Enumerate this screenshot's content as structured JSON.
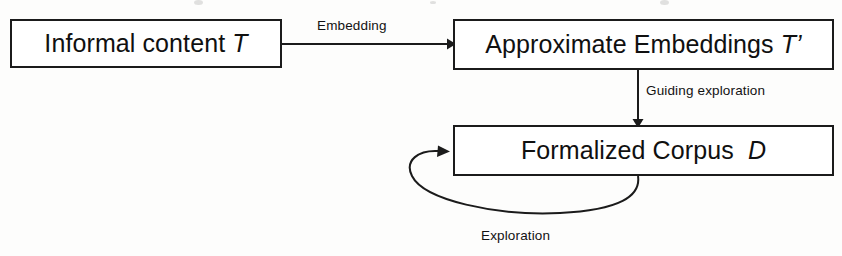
{
  "diagram": {
    "stroke_color": "#1b1b1b",
    "background_color": "#fdfdfc",
    "nodes": [
      {
        "id": "informal-content",
        "label": "Informal content ",
        "symbol": "T",
        "shape": "rectangle"
      },
      {
        "id": "approximate-embeddings",
        "label": "Approximate Embeddings ",
        "symbol": "T’",
        "shape": "rectangle"
      },
      {
        "id": "formalized-corpus",
        "label": "Formalized Corpus  ",
        "symbol": "D",
        "shape": "rectangle"
      }
    ],
    "edges": [
      {
        "id": "embedding-edge",
        "label": "Embedding",
        "from": "informal-content",
        "to": "approximate-embeddings",
        "direction": "right"
      },
      {
        "id": "guiding-exploration-edge",
        "label": "Guiding exploration",
        "from": "approximate-embeddings",
        "to": "formalized-corpus",
        "direction": "down"
      },
      {
        "id": "exploration-loop-edge",
        "label": "Exploration",
        "from": "formalized-corpus",
        "to": "formalized-corpus",
        "direction": "self-loop"
      }
    ]
  }
}
